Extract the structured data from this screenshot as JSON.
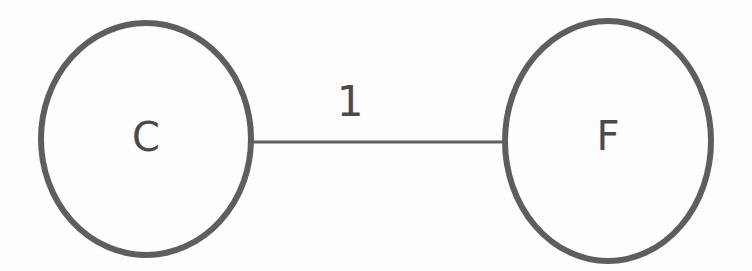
{
  "diagram": {
    "type": "undirected-weighted-graph",
    "background_color": "#fefefe",
    "stroke_color": "#5e5e5e",
    "text_color": "#4a4a4a",
    "canvas": {
      "width": 752,
      "height": 271
    },
    "nodes": [
      {
        "id": "C",
        "label": "C",
        "shape": "ellipse",
        "cx": 146,
        "cy": 139,
        "rx": 105,
        "ry": 116,
        "stroke_width": 6,
        "label_x": 146,
        "label_y": 137,
        "label_font_size": 40
      },
      {
        "id": "F",
        "label": "F",
        "shape": "ellipse",
        "cx": 608,
        "cy": 141,
        "rx": 103,
        "ry": 120,
        "stroke_width": 6,
        "label_x": 608,
        "label_y": 136,
        "label_font_size": 40
      }
    ],
    "edges": [
      {
        "id": "C-F",
        "source": "C",
        "target": "F",
        "label": "1",
        "x1": 250,
        "y1": 142,
        "x2": 506,
        "y2": 142,
        "stroke_width": 3,
        "label_x": 350,
        "label_y": 101,
        "label_font_size": 42
      }
    ]
  }
}
